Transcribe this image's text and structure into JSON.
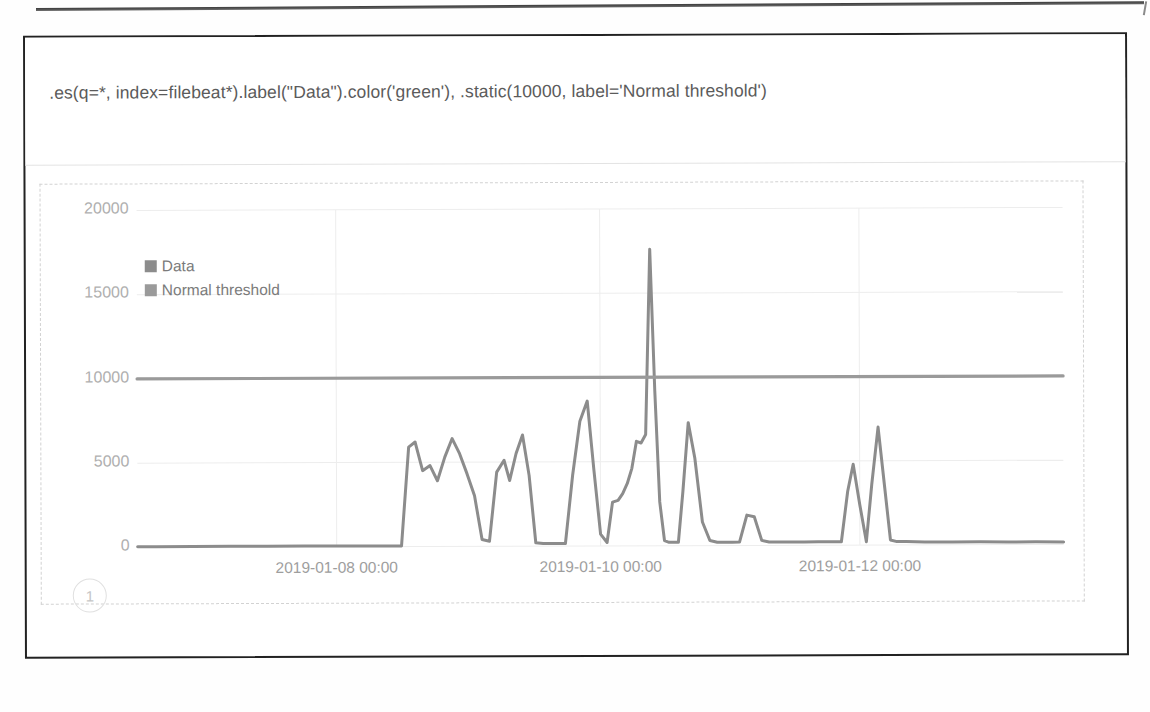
{
  "app": {
    "name": "Kibana Timelion",
    "panel_title": ""
  },
  "expression": {
    "name": "timelion-expression-input",
    "value": ".es(q=*, index=filebeat*).label(\"Data\").color('green'), .static(10000, label='Normal threshold')",
    "placeholder": "Enter a Timelion expression"
  },
  "annotation": {
    "marker_label": "1"
  },
  "colors": {
    "data_series": "#8c8c8c",
    "threshold_series": "#9a9a9a",
    "gridline": "#ededed",
    "axis_text": "#aaaaaa",
    "dashed_border": "#d2d2d2",
    "panel_border": "#222222",
    "expression_text": "#5b5b5b"
  },
  "chart_data": {
    "type": "line",
    "title": "",
    "xlabel": "",
    "ylabel": "",
    "ylim": [
      0,
      20000
    ],
    "yticks": [
      0,
      5000,
      10000,
      15000,
      20000
    ],
    "ytick_labels": [
      "0",
      "5000",
      "10000",
      "15000",
      "20000"
    ],
    "xticks": [
      "2019-01-08 00:00",
      "2019-01-10 00:00",
      "2019-01-12 00:00"
    ],
    "xtick_positions_pct": [
      21.5,
      50.0,
      78.0
    ],
    "grid": true,
    "legend_position": "top-left",
    "legend": [
      "Data",
      "Normal threshold"
    ],
    "series": [
      {
        "name": "Data",
        "color": "#8c8c8c",
        "x_pct": [
          0.0,
          2.0,
          6.0,
          10.0,
          14.0,
          18.0,
          22.0,
          25.0,
          27.0,
          28.5,
          29.3,
          30.0,
          30.8,
          31.6,
          32.4,
          33.2,
          34.0,
          34.8,
          35.6,
          36.4,
          37.2,
          38.0,
          38.8,
          39.6,
          40.2,
          40.9,
          41.6,
          42.3,
          43.0,
          43.8,
          44.6,
          45.4,
          46.2,
          47.0,
          47.8,
          48.6,
          49.3,
          50.0,
          50.7,
          51.3,
          51.9,
          52.4,
          52.9,
          53.4,
          53.9,
          54.4,
          54.9,
          55.4,
          55.9,
          56.4,
          56.9,
          57.4,
          57.9,
          58.4,
          58.9,
          59.5,
          60.2,
          61.0,
          61.8,
          62.6,
          63.4,
          64.2,
          65.0,
          65.8,
          66.6,
          67.4,
          68.2,
          69.0,
          70.0,
          71.0,
          72.0,
          73.5,
          75.0,
          76.0,
          76.7,
          77.3,
          78.0,
          78.7,
          79.3,
          80.0,
          80.7,
          81.3,
          82.0,
          83.0,
          85.0,
          88.0,
          91.0,
          94.0,
          97.0,
          100.0
        ],
        "y": [
          40,
          40,
          40,
          45,
          40,
          45,
          40,
          45,
          40,
          40,
          5900,
          6200,
          4500,
          4800,
          3900,
          5300,
          6400,
          5500,
          4300,
          3000,
          400,
          300,
          4400,
          5100,
          3900,
          5500,
          6600,
          4200,
          200,
          150,
          150,
          150,
          150,
          4200,
          7400,
          8600,
          4500,
          700,
          200,
          2600,
          2700,
          3100,
          3700,
          4600,
          6200,
          6100,
          6600,
          17600,
          9200,
          2600,
          300,
          200,
          200,
          200,
          3200,
          7300,
          5200,
          1400,
          300,
          200,
          200,
          200,
          200,
          1800,
          1700,
          300,
          200,
          200,
          200,
          200,
          200,
          200,
          200,
          200,
          3200,
          4800,
          2400,
          200,
          3600,
          7000,
          3400,
          300,
          200,
          200,
          180,
          170,
          170,
          160,
          160,
          150
        ]
      },
      {
        "name": "Normal threshold",
        "color": "#9a9a9a",
        "constant": 10000
      }
    ]
  }
}
